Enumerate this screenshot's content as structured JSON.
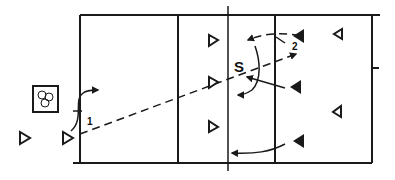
{
  "diagram": {
    "type": "volleyball-drill",
    "colors": {
      "line": "#1a1a1a",
      "background": "#ffffff"
    },
    "labels": {
      "step_1": "1",
      "step_2": "2",
      "setter": "S"
    },
    "court": {
      "left": 80,
      "top": 15,
      "right": 372,
      "bottom": 163,
      "attack_line_left_x": 178,
      "net_x": 228,
      "attack_line_right_x": 275
    },
    "ball_basket": {
      "icon": "ball-basket-icon",
      "balls": 3
    },
    "players": {
      "team_open_triangles_right_facing": [
        {
          "name": "waiting-player",
          "x": 24,
          "y": 137
        },
        {
          "name": "server-1",
          "x": 67,
          "y": 137
        },
        {
          "name": "player-left-back",
          "x": 210,
          "y": 40
        },
        {
          "name": "player-left-mid",
          "x": 210,
          "y": 82
        },
        {
          "name": "player-left-low",
          "x": 210,
          "y": 127
        }
      ],
      "team_filled_triangles_left_facing": [
        {
          "name": "blocker-top",
          "x": 300,
          "y": 36
        },
        {
          "name": "blocker-mid",
          "x": 296,
          "y": 88
        },
        {
          "name": "blocker-low",
          "x": 300,
          "y": 141
        }
      ],
      "team_open_triangles_left_facing": [
        {
          "name": "back-top",
          "x": 337,
          "y": 34
        },
        {
          "name": "back-low",
          "x": 336,
          "y": 112
        }
      ]
    }
  }
}
